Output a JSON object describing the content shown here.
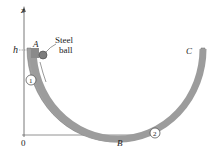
{
  "figure": {
    "axis_z_label": "z",
    "origin_label": "0",
    "height_label": "h",
    "point_A": "A",
    "point_B": "B",
    "point_C": "C",
    "ball_label_line1": "Steel",
    "ball_label_line2": "ball",
    "marker_1": "1",
    "marker_2": "2",
    "colors": {
      "track": "#9a9a9a",
      "track_edge": "#6e6e6e",
      "ball": "#7d7d7d",
      "axis": "#555555",
      "text": "#222222"
    }
  }
}
